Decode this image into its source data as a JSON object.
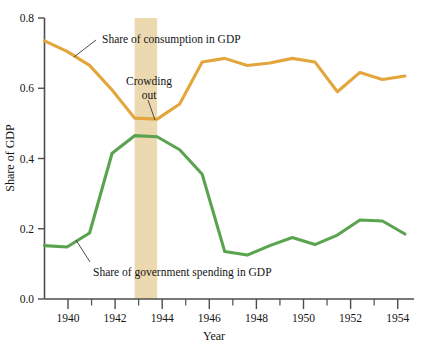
{
  "chart_data": {
    "type": "line",
    "title": "",
    "xlabel": "Year",
    "ylabel": "Share of GDP",
    "xlim": [
      1939,
      1955.4
    ],
    "ylim": [
      0.0,
      0.8
    ],
    "grid": false,
    "legend_position": "inline-annotations",
    "xticks_major": [
      1940,
      1942,
      1944,
      1946,
      1948,
      1950,
      1952,
      1954
    ],
    "xticklabels": [
      "1940",
      "1942",
      "1944",
      "1946",
      "1948",
      "1950",
      "1952",
      "1954"
    ],
    "xticks_minor": [
      1941,
      1943,
      1945,
      1947,
      1949,
      1951,
      1953,
      1955
    ],
    "yticks": [
      0.0,
      0.2,
      0.4,
      0.6,
      0.8
    ],
    "yticklabels": [
      "0.0",
      "0.2",
      "0.4",
      "0.6",
      "0.8"
    ],
    "x": [
      1939,
      1940,
      1941,
      1942,
      1943,
      1944,
      1945,
      1946,
      1947,
      1948,
      1949,
      1950,
      1951,
      1952,
      1953,
      1954,
      1955
    ],
    "series": [
      {
        "name": "Share of consumption in GDP",
        "color": "#e3a63c",
        "values": [
          0.735,
          0.705,
          0.665,
          0.595,
          0.515,
          0.512,
          0.555,
          0.675,
          0.685,
          0.665,
          0.672,
          0.685,
          0.675,
          0.59,
          0.645,
          0.625,
          0.635
        ]
      },
      {
        "name": "Share of government spending in GDP",
        "color": "#5aa34f",
        "values": [
          0.152,
          0.148,
          0.188,
          0.415,
          0.465,
          0.462,
          0.425,
          0.355,
          0.135,
          0.125,
          0.152,
          0.175,
          0.155,
          0.182,
          0.225,
          0.222,
          0.185
        ]
      }
    ],
    "highlight_band": {
      "label": "Crowding out",
      "x_start": 1943.0,
      "x_end": 1944.0,
      "color": "#ecd9b0"
    },
    "annotations": [
      {
        "text": "Share of consumption in GDP",
        "target_series": "Share of consumption in GDP",
        "leader": true
      },
      {
        "text": "Crowding out",
        "target": "highlight-band",
        "leader": true
      },
      {
        "text": "Share of government spending in GDP",
        "target_series": "Share of government spending in GDP",
        "leader": true
      }
    ]
  },
  "labels": {
    "y_axis_title": "Share of GDP",
    "x_axis_title": "Year",
    "consumption_label": "Share of consumption in GDP",
    "crowding_line1": "Crowding",
    "crowding_line2": "out",
    "government_label": "Share of government spending in GDP",
    "ytick_0": "0.0",
    "ytick_1": "0.2",
    "ytick_2": "0.4",
    "ytick_3": "0.6",
    "ytick_4": "0.8",
    "xtick_0": "1940",
    "xtick_1": "1942",
    "xtick_2": "1944",
    "xtick_3": "1946",
    "xtick_4": "1948",
    "xtick_5": "1950",
    "xtick_6": "1952",
    "xtick_7": "1954"
  },
  "colors": {
    "consumption": "#e3a63c",
    "government": "#5aa34f",
    "band": "#ecd9b0",
    "axis": "#4d4d4d",
    "text": "#141414",
    "background": "#ffffff"
  }
}
